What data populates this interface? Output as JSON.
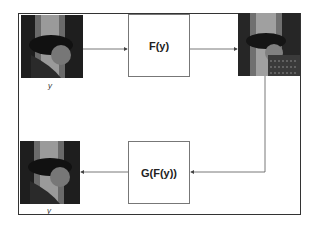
{
  "diagram": {
    "input_label": "y",
    "forward_box": "F(y)",
    "backward_box": "G(F(y))",
    "output_label": "y",
    "images": [
      "input-image",
      "transformed-image",
      "reconstructed-image"
    ]
  }
}
